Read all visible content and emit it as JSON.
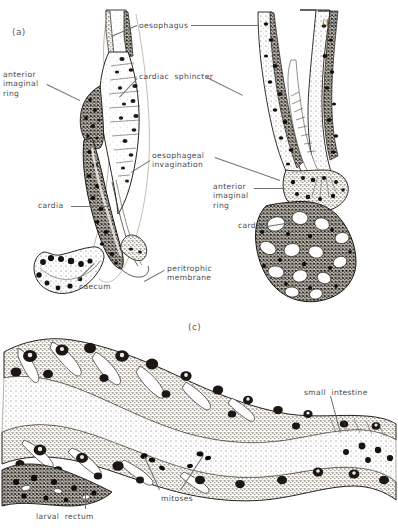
{
  "figure": {
    "title_visible": false,
    "panels": [
      {
        "id": "a",
        "letter": "(a)",
        "x": 12,
        "y": 27
      },
      {
        "id": "b",
        "letter": "(b)",
        "x": 322,
        "y": 18
      },
      {
        "id": "c",
        "letter": "(c)",
        "x": 188,
        "y": 322
      }
    ],
    "labels": [
      {
        "key": "oesophagus",
        "lines": [
          "oesophagus"
        ],
        "x": 139,
        "y": 21,
        "align": "left",
        "panel": "shared"
      },
      {
        "key": "anterior_imaginal_ring_a",
        "lines": [
          "anterior",
          "imaginal",
          "ring"
        ],
        "x": 3,
        "y": 70,
        "align": "left",
        "panel": "a"
      },
      {
        "key": "cardiac_sphincter",
        "lines": [
          "cardiac  sphincter"
        ],
        "x": 139,
        "y": 72,
        "align": "left",
        "panel": "shared"
      },
      {
        "key": "oesophageal_invagination",
        "lines": [
          "oesophageal",
          "invagination"
        ],
        "x": 152,
        "y": 151,
        "align": "left",
        "panel": "shared"
      },
      {
        "key": "anterior_imaginal_ring_b",
        "lines": [
          "anterior",
          "imaginal",
          "ring"
        ],
        "x": 213,
        "y": 182,
        "align": "left",
        "panel": "b"
      },
      {
        "key": "cardia_a",
        "lines": [
          "cardia"
        ],
        "x": 38,
        "y": 201,
        "align": "left",
        "panel": "a"
      },
      {
        "key": "cardia_b",
        "lines": [
          "cardia"
        ],
        "x": 238,
        "y": 221,
        "align": "left",
        "panel": "b"
      },
      {
        "key": "peritrophic_membrane",
        "lines": [
          "peritrophic",
          "membrane"
        ],
        "x": 167,
        "y": 264,
        "align": "left",
        "panel": "a"
      },
      {
        "key": "caecum",
        "lines": [
          "caecum"
        ],
        "x": 79,
        "y": 282,
        "align": "left",
        "panel": "a"
      },
      {
        "key": "small_intestine",
        "lines": [
          "small  intestine"
        ],
        "x": 304,
        "y": 388,
        "align": "left",
        "panel": "c"
      },
      {
        "key": "mitoses",
        "lines": [
          "mitoses"
        ],
        "x": 161,
        "y": 494,
        "align": "left",
        "panel": "c"
      },
      {
        "key": "larval_rectum",
        "lines": [
          "larval  rectum"
        ],
        "x": 36,
        "y": 512,
        "align": "left",
        "panel": "c"
      }
    ],
    "leaders": [
      {
        "key": "leader-oesophagus-left",
        "x1": 111,
        "y1": 36,
        "x2": 137,
        "y2": 25
      },
      {
        "key": "leader-oesophagus-right",
        "x1": 191,
        "y1": 25,
        "x2": 259,
        "y2": 25
      },
      {
        "key": "leader-anterior-ring-a",
        "x1": 47,
        "y1": 84,
        "x2": 80,
        "y2": 100
      },
      {
        "key": "leader-cardiac-left",
        "x1": 119,
        "y1": 97,
        "x2": 137,
        "y2": 78
      },
      {
        "key": "leader-cardiac-right",
        "x1": 207,
        "y1": 77,
        "x2": 243,
        "y2": 95
      },
      {
        "key": "leader-invagination-a",
        "x1": 131,
        "y1": 172,
        "x2": 150,
        "y2": 160
      },
      {
        "key": "leader-invagination-b",
        "x1": 215,
        "y1": 157,
        "x2": 280,
        "y2": 180
      },
      {
        "key": "leader-anterior-ring-b",
        "x1": 254,
        "y1": 188,
        "x2": 285,
        "y2": 188
      },
      {
        "key": "leader-cardia-a",
        "x1": 71,
        "y1": 206,
        "x2": 110,
        "y2": 206
      },
      {
        "key": "leader-cardia-b",
        "x1": 267,
        "y1": 226,
        "x2": 292,
        "y2": 222
      },
      {
        "key": "leader-peritrophic",
        "x1": 144,
        "y1": 281,
        "x2": 164,
        "y2": 270
      },
      {
        "key": "leader-caecum",
        "x1": 77,
        "y1": 280,
        "x2": 94,
        "y2": 263
      },
      {
        "key": "leader-small-intestine",
        "x1": 331,
        "y1": 396,
        "x2": 341,
        "y2": 433
      },
      {
        "key": "leader-mitoses-left",
        "x1": 159,
        "y1": 490,
        "x2": 144,
        "y2": 457
      },
      {
        "key": "leader-mitoses-right",
        "x1": 180,
        "y1": 490,
        "x2": 203,
        "y2": 455
      },
      {
        "key": "leader-larval-rectum",
        "x1": 85,
        "y1": 509,
        "x2": 85,
        "y2": 486
      }
    ],
    "colors": {
      "ink": "#1a1a1a",
      "label_text": "#4a4a4a",
      "leader_line": "#6e6e6e",
      "background": "#ffffff",
      "tissue_light": "#f2efe8",
      "tissue_mid": "#b9b2a4",
      "tissue_dark": "#2e2a26"
    }
  }
}
